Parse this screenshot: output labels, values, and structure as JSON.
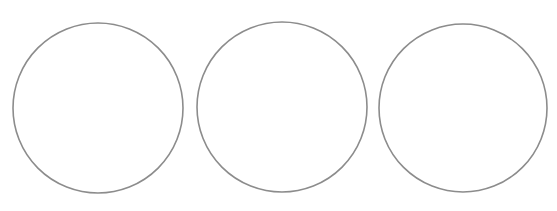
{
  "canvas": {
    "width": 557,
    "height": 211,
    "background": "#ffffff"
  },
  "stroke_color": "#8c8c8c",
  "circles": [
    {
      "cx": 98,
      "cy": 108,
      "r": 85
    },
    {
      "cx": 282,
      "cy": 107,
      "r": 85
    },
    {
      "cx": 463,
      "cy": 108,
      "r": 84
    }
  ]
}
